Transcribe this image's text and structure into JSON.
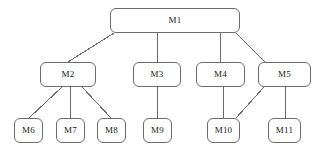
{
  "diagram": {
    "type": "hierarchy-tree",
    "title": "",
    "background_color": "#ffffff",
    "node_border_color": "#6b6b6b",
    "node_fill_color": "#ffffff",
    "edge_color": "#6b6b6b",
    "text_color": "#1a1a1a",
    "nodes": [
      {
        "id": "M1",
        "label": "M1",
        "level": 1,
        "x": 110,
        "y": 8,
        "w": 130,
        "h": 25
      },
      {
        "id": "M2",
        "label": "M2",
        "level": 2,
        "x": 40,
        "y": 62,
        "w": 56,
        "h": 25
      },
      {
        "id": "M3",
        "label": "M3",
        "level": 2,
        "x": 133,
        "y": 62,
        "w": 48,
        "h": 25
      },
      {
        "id": "M4",
        "label": "M4",
        "level": 2,
        "x": 196,
        "y": 62,
        "w": 49,
        "h": 25
      },
      {
        "id": "M5",
        "label": "M5",
        "level": 2,
        "x": 258,
        "y": 62,
        "w": 53,
        "h": 25
      },
      {
        "id": "M6",
        "label": "M6",
        "level": 3,
        "x": 14,
        "y": 118,
        "w": 29,
        "h": 25
      },
      {
        "id": "M7",
        "label": "M7",
        "level": 3,
        "x": 56,
        "y": 118,
        "w": 29,
        "h": 25
      },
      {
        "id": "M8",
        "label": "M8",
        "level": 3,
        "x": 97,
        "y": 118,
        "w": 29,
        "h": 25
      },
      {
        "id": "M9",
        "label": "M9",
        "level": 3,
        "x": 143,
        "y": 118,
        "w": 29,
        "h": 25
      },
      {
        "id": "M10",
        "label": "M10",
        "level": 3,
        "x": 207,
        "y": 118,
        "w": 33,
        "h": 25
      },
      {
        "id": "M11",
        "label": "M11",
        "level": 3,
        "x": 268,
        "y": 118,
        "w": 33,
        "h": 25
      }
    ],
    "edges": [
      {
        "from": "M1",
        "to": "M2",
        "x1": 114,
        "y1": 33,
        "x2": 68,
        "y2": 62
      },
      {
        "from": "M1",
        "to": "M3",
        "x1": 157,
        "y1": 33,
        "x2": 157,
        "y2": 62
      },
      {
        "from": "M1",
        "to": "M4",
        "x1": 220,
        "y1": 33,
        "x2": 220,
        "y2": 62
      },
      {
        "from": "M1",
        "to": "M5",
        "x1": 236,
        "y1": 33,
        "x2": 265,
        "y2": 62
      },
      {
        "from": "M2",
        "to": "M6",
        "x1": 62,
        "y1": 87,
        "x2": 29,
        "y2": 118
      },
      {
        "from": "M2",
        "to": "M7",
        "x1": 70,
        "y1": 87,
        "x2": 70,
        "y2": 118
      },
      {
        "from": "M2",
        "to": "M8",
        "x1": 82,
        "y1": 87,
        "x2": 111,
        "y2": 118
      },
      {
        "from": "M3",
        "to": "M9",
        "x1": 157,
        "y1": 87,
        "x2": 157,
        "y2": 118
      },
      {
        "from": "M4",
        "to": "M10",
        "x1": 223,
        "y1": 87,
        "x2": 223,
        "y2": 118
      },
      {
        "from": "M5",
        "to": "M10",
        "x1": 264,
        "y1": 87,
        "x2": 236,
        "y2": 118
      },
      {
        "from": "M5",
        "to": "M11",
        "x1": 285,
        "y1": 87,
        "x2": 285,
        "y2": 118
      }
    ]
  }
}
